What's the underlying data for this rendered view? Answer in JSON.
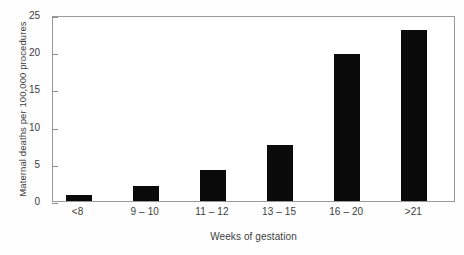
{
  "chart_data": {
    "type": "bar",
    "title": "",
    "xlabel": "Weeks of gestation",
    "ylabel": "Maternal deaths per 100,000 procedures",
    "categories": [
      "<8",
      "9 – 10",
      "11 – 12",
      "13 – 15",
      "16 – 20",
      ">21"
    ],
    "values": [
      0.8,
      2.0,
      4.2,
      7.5,
      19.7,
      23.0
    ],
    "ylim": [
      0,
      25
    ],
    "yticks": [
      0,
      5,
      10,
      15,
      20,
      25
    ],
    "ytick_labels": [
      "0",
      "5",
      "10",
      "15",
      "20",
      "25"
    ],
    "grid": false,
    "legend": null,
    "bar_color": "#0a0a0a",
    "axis_color": "#9a9a9a",
    "background": "#ffffff"
  }
}
